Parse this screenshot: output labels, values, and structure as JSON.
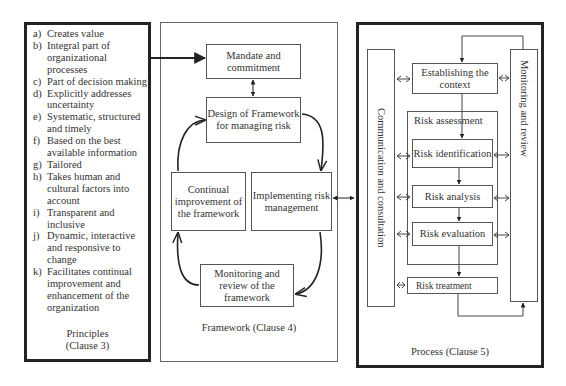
{
  "principles": {
    "items": [
      {
        "key": "a)",
        "text": "Creates value"
      },
      {
        "key": "b)",
        "text": "Integral part of organizational processes"
      },
      {
        "key": "c)",
        "text": "Part of decision making"
      },
      {
        "key": "d)",
        "text": "Explicitly addresses uncertainty"
      },
      {
        "key": "e)",
        "text": "Systematic, structured and timely"
      },
      {
        "key": "f)",
        "text": "Based on the best available information"
      },
      {
        "key": "g)",
        "text": "Tailored"
      },
      {
        "key": "h)",
        "text": "Takes human and cultural factors  into account"
      },
      {
        "key": "i)",
        "text": "Transparent and inclusive"
      },
      {
        "key": "j)",
        "text": "Dynamic, interactive and responsive to change"
      },
      {
        "key": "k)",
        "text": "Facilitates continual improvement and enhancement of the organization"
      }
    ],
    "caption_line1": "Principles",
    "caption_line2": "(Clause 3)"
  },
  "framework": {
    "mandate": "Mandate and commitment",
    "design": "Design of Framework for managing risk",
    "implementing": "Implementing risk management",
    "monitoring": "Monitoring and review of the framework",
    "continual": "Continual improvement of the framework",
    "caption": "Framework (Clause 4)"
  },
  "process": {
    "communication": "Communication and consultation",
    "monitoring": "Monitoring and review",
    "context": "Establishing the context",
    "assessment": "Risk assessment",
    "identification": "Risk identification",
    "analysis": "Risk analysis",
    "evaluation": "Risk evaluation",
    "treatment": "Risk treatment",
    "caption": "Process (Clause 5)"
  }
}
